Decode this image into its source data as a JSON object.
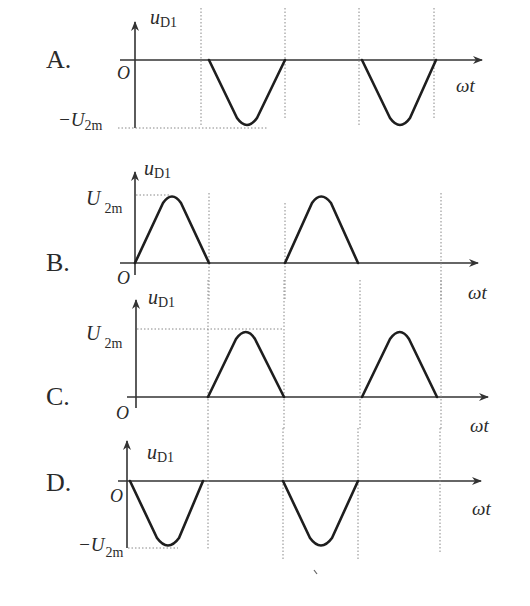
{
  "figure": {
    "y_label_main": "u",
    "y_label_sub": "D1",
    "x_label": "ωt",
    "origin_label": "O",
    "amplitude_label_main": "U",
    "amplitude_label_sub": "2m",
    "neg_sign": "−"
  },
  "options": [
    {
      "letter": "A.",
      "polarity": "negative",
      "pulses": "2nd and 4th half-cycles",
      "amplitude": "-U2m"
    },
    {
      "letter": "B.",
      "polarity": "positive",
      "pulses": "1st and 3rd half-cycles",
      "amplitude": "U2m"
    },
    {
      "letter": "C.",
      "polarity": "positive",
      "pulses": "2nd and 4th half-cycles",
      "amplitude": "U2m"
    },
    {
      "letter": "D.",
      "polarity": "negative",
      "pulses": "1st and 3rd half-cycles",
      "amplitude": "-U2m"
    }
  ],
  "colors": {
    "wave": "#1e1e1e",
    "axis": "#333333",
    "guide": "#888888"
  }
}
